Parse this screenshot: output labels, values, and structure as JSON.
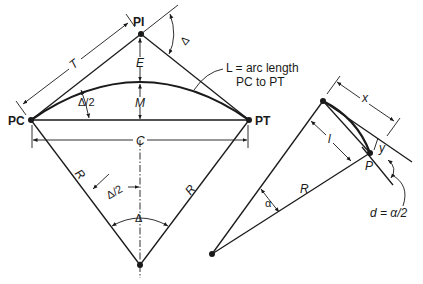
{
  "figure": {
    "colors": {
      "ink": "#1a1a1a",
      "background": "#ffffff"
    }
  },
  "main_curve": {
    "points": {
      "pi": "PI",
      "pc": "PC",
      "pt": "PT"
    },
    "labels": {
      "tangent": "T",
      "external": "E",
      "middle_ordinate": "M",
      "chord": "C",
      "radius_left": "R",
      "radius_right": "R",
      "deflection": "Δ",
      "half_deflection_top": "Δ/2",
      "half_deflection_center": "Δ/2",
      "central_angle": "Δ"
    },
    "callout": {
      "line1": "L = arc length",
      "line2": "PC to PT"
    }
  },
  "inset": {
    "labels": {
      "x": "x",
      "y": "y",
      "l": "l",
      "radius": "R",
      "point": "P",
      "alpha": "α",
      "deflection_formula": "d = α/2"
    }
  }
}
